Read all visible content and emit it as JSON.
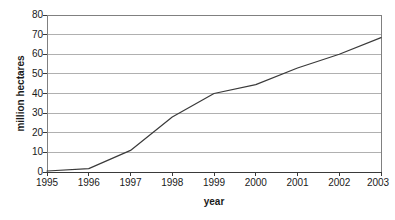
{
  "chart_data": {
    "type": "line",
    "title": "",
    "xlabel": "year",
    "ylabel": "million hectares",
    "categories": [
      "1995",
      "1996",
      "1997",
      "1998",
      "1999",
      "2000",
      "2001",
      "2002",
      "2003"
    ],
    "x": [
      1995,
      1996,
      1997,
      1998,
      1999,
      2000,
      2001,
      2002,
      2003
    ],
    "values": [
      0.5,
      1.7,
      11,
      28,
      40,
      44.5,
      53,
      60,
      68.5
    ],
    "series": [
      {
        "name": "million hectares",
        "values": [
          0.5,
          1.7,
          11,
          28,
          40,
          44.5,
          53,
          60,
          68.5
        ]
      }
    ],
    "xlim": [
      1995,
      2003
    ],
    "ylim": [
      0,
      80
    ],
    "ytick_labels": [
      "0",
      "10",
      "20",
      "30",
      "40",
      "50",
      "60",
      "70",
      "80"
    ],
    "yticks": [
      0,
      10,
      20,
      30,
      40,
      50,
      60,
      70,
      80
    ],
    "xtick_labels": [
      "1995",
      "1996",
      "1997",
      "1998",
      "1999",
      "2000",
      "2001",
      "2002",
      "2003"
    ],
    "grid": "horizontal",
    "legend": "none",
    "markers": "none",
    "line_color": "#3a3a3a",
    "grid_color": "#b0b0b0",
    "axis_color": "#808080",
    "background_color": "#ffffff",
    "plot_area": {
      "left": 47,
      "top": 15,
      "right": 381,
      "bottom": 172
    }
  }
}
